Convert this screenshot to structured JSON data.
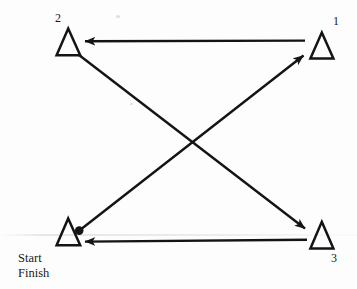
{
  "diagram": {
    "type": "node-link",
    "width": 357,
    "height": 289,
    "stroke_color": "#141414",
    "background_color": "#fdfdfd",
    "nodes": [
      {
        "id": "mark-2",
        "label": "2",
        "shape": "triangle-outline",
        "x": 68,
        "y": 42,
        "label_x": 55,
        "label_y": 12
      },
      {
        "id": "mark-1",
        "label": "1",
        "shape": "triangle-outline",
        "x": 322,
        "y": 46,
        "label_x": 333,
        "label_y": 15
      },
      {
        "id": "mark-start-finish",
        "label": "",
        "shape": "triangle-outline",
        "x": 68,
        "y": 232,
        "label_x": 18,
        "label_y": 252
      },
      {
        "id": "mark-3",
        "label": "3",
        "shape": "triangle-outline",
        "x": 322,
        "y": 235,
        "label_x": 331,
        "label_y": 252
      }
    ],
    "corner_labels": [
      {
        "id": "start-label",
        "text": "Start",
        "x": 18,
        "y": 251
      },
      {
        "id": "finish-label",
        "text": "Finish",
        "x": 18,
        "y": 266
      }
    ],
    "start_marker": {
      "id": "start-dot",
      "shape": "filled-circle",
      "x": 79,
      "y": 231,
      "radius": 4
    },
    "edges": [
      {
        "id": "leg-start-to-1",
        "from": "mark-start-finish",
        "to": "mark-1",
        "x1": 80,
        "y1": 230,
        "x2": 306,
        "y2": 54,
        "arrow": "end",
        "direction": "up-right"
      },
      {
        "id": "leg-1-to-2",
        "from": "mark-1",
        "to": "mark-2",
        "x1": 305,
        "y1": 41,
        "x2": 82,
        "y2": 41,
        "arrow": "end",
        "direction": "left"
      },
      {
        "id": "leg-2-to-3",
        "from": "mark-2",
        "to": "mark-3",
        "x1": 79,
        "y1": 55,
        "x2": 308,
        "y2": 231,
        "arrow": "end",
        "direction": "down-right"
      },
      {
        "id": "leg-3-to-finish",
        "from": "mark-3",
        "to": "mark-start-finish",
        "x1": 307,
        "y1": 240,
        "x2": 82,
        "y2": 242,
        "arrow": "end",
        "direction": "left"
      }
    ]
  }
}
